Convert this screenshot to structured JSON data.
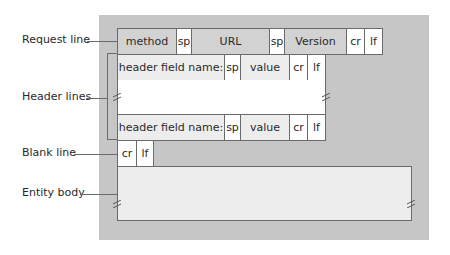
{
  "labels": {
    "request_line": "Request line",
    "header_lines": "Header lines",
    "blank_line": "Blank line",
    "entity_body": "Entity body"
  },
  "request_line": {
    "method": "method",
    "sp1": "sp",
    "url": "URL",
    "sp2": "sp",
    "version": "Version",
    "cr": "cr",
    "lf": "lf"
  },
  "header_rows": [
    {
      "name": "header field name:",
      "sp": "sp",
      "value": "value",
      "cr": "cr",
      "lf": "lf"
    },
    {
      "name": "header field name:",
      "sp": "sp",
      "value": "value",
      "cr": "cr",
      "lf": "lf"
    }
  ],
  "blank_line": {
    "cr": "cr",
    "lf": "lf"
  },
  "colors": {
    "background_panel": "#c6c6c6",
    "mid_cell": "#d2d2d2",
    "light_cell": "#ededed",
    "white_cell": "#ffffff",
    "border": "#6a6a6a"
  }
}
